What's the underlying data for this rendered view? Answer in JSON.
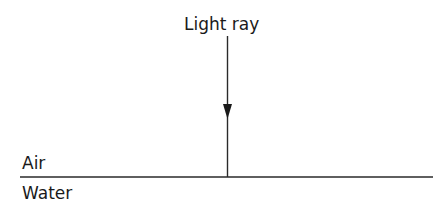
{
  "diagram": {
    "ray_label": "Light ray",
    "upper_medium": "Air",
    "lower_medium": "Water",
    "colors": {
      "line": "#2a2a2a",
      "text": "#1a1a1a",
      "background": "#ffffff"
    }
  }
}
